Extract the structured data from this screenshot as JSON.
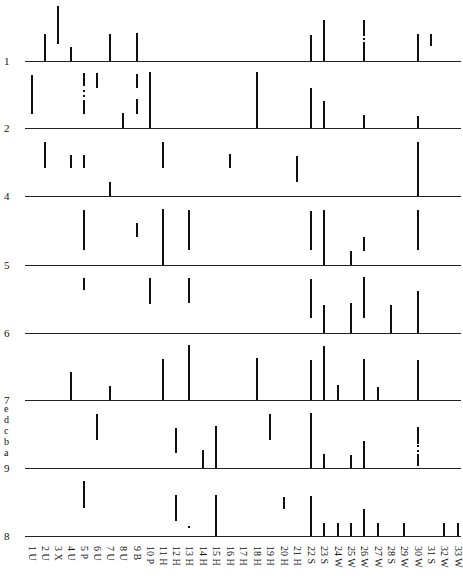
{
  "chart_data": {
    "type": "table",
    "rows": [
      {
        "label": "1",
        "baseline_y": 61
      },
      {
        "label": "2",
        "baseline_y": 128
      },
      {
        "label": "4",
        "baseline_y": 196
      },
      {
        "label": "5",
        "baseline_y": 265
      },
      {
        "label": "6",
        "baseline_y": 333
      },
      {
        "label": "7",
        "baseline_y": 400
      },
      {
        "label": "9",
        "baseline_y": 468,
        "sub_labels": [
          "e",
          "d",
          "c",
          "b",
          "a"
        ]
      },
      {
        "label": "8",
        "baseline_y": 536
      }
    ],
    "categories": [
      "1 U",
      "2 U",
      "3 X",
      "4 U",
      "5 P",
      "6 U",
      "7 U",
      "8 U",
      "9 B",
      "10 P",
      "11 H",
      "12 H",
      "13 H",
      "14 H",
      "15 H",
      "16 H",
      "17 H",
      "18 H",
      "19 H",
      "20 H",
      "21 H",
      "22 S",
      "23 S",
      "24 W",
      "25 W",
      "26 W",
      "27 W",
      "28 S",
      "29 W",
      "30 W",
      "31 S",
      "32 W",
      "33 W"
    ],
    "column_x": [
      32,
      45,
      58,
      71,
      84,
      97,
      110,
      123,
      137,
      150,
      163,
      176,
      189,
      203,
      216,
      230,
      243,
      257,
      270,
      284,
      297,
      311,
      324,
      338,
      351,
      364,
      378,
      391,
      404,
      418,
      431,
      444,
      458
    ],
    "segments": [
      {
        "row": 0,
        "col": 2,
        "y1": 34,
        "y2": 61
      },
      {
        "row": 0,
        "col": 3,
        "y1": 6,
        "y2": 44
      },
      {
        "row": 0,
        "col": 4,
        "y1": 47,
        "y2": 61
      },
      {
        "row": 0,
        "col": 7,
        "y1": 34,
        "y2": 61
      },
      {
        "row": 0,
        "col": 9,
        "y1": 33,
        "y2": 61
      },
      {
        "row": 0,
        "col": 22,
        "y1": 35,
        "y2": 61
      },
      {
        "row": 0,
        "col": 23,
        "y1": 20,
        "y2": 61
      },
      {
        "row": 0,
        "col": 26,
        "y1": 20,
        "y2": 36
      },
      {
        "row": 0,
        "col": 26,
        "y1": 38,
        "y2": 40
      },
      {
        "row": 0,
        "col": 26,
        "y1": 42,
        "y2": 61
      },
      {
        "row": 0,
        "col": 30,
        "y1": 34,
        "y2": 61
      },
      {
        "row": 0,
        "col": 31,
        "y1": 34,
        "y2": 46
      },
      {
        "row": 1,
        "col": 1,
        "y1": 75,
        "y2": 114
      },
      {
        "row": 1,
        "col": 5,
        "y1": 73,
        "y2": 86
      },
      {
        "row": 1,
        "col": 5,
        "y1": 90,
        "y2": 92
      },
      {
        "row": 1,
        "col": 5,
        "y1": 95,
        "y2": 97
      },
      {
        "row": 1,
        "col": 5,
        "y1": 100,
        "y2": 114
      },
      {
        "row": 1,
        "col": 6,
        "y1": 73,
        "y2": 88
      },
      {
        "row": 1,
        "col": 8,
        "y1": 113,
        "y2": 128
      },
      {
        "row": 1,
        "col": 9,
        "y1": 74,
        "y2": 88
      },
      {
        "row": 1,
        "col": 9,
        "y1": 99,
        "y2": 114
      },
      {
        "row": 1,
        "col": 10,
        "y1": 72,
        "y2": 128
      },
      {
        "row": 1,
        "col": 18,
        "y1": 72,
        "y2": 128
      },
      {
        "row": 1,
        "col": 22,
        "y1": 88,
        "y2": 128
      },
      {
        "row": 1,
        "col": 23,
        "y1": 101,
        "y2": 128
      },
      {
        "row": 1,
        "col": 26,
        "y1": 115,
        "y2": 128
      },
      {
        "row": 1,
        "col": 30,
        "y1": 116,
        "y2": 128
      },
      {
        "row": 2,
        "col": 2,
        "y1": 142,
        "y2": 168
      },
      {
        "row": 2,
        "col": 4,
        "y1": 155,
        "y2": 168
      },
      {
        "row": 2,
        "col": 5,
        "y1": 155,
        "y2": 168
      },
      {
        "row": 2,
        "col": 7,
        "y1": 182,
        "y2": 196
      },
      {
        "row": 2,
        "col": 11,
        "y1": 142,
        "y2": 168
      },
      {
        "row": 2,
        "col": 16,
        "y1": 154,
        "y2": 168
      },
      {
        "row": 2,
        "col": 21,
        "y1": 156,
        "y2": 182
      },
      {
        "row": 2,
        "col": 30,
        "y1": 142,
        "y2": 196
      },
      {
        "row": 3,
        "col": 5,
        "y1": 210,
        "y2": 250
      },
      {
        "row": 3,
        "col": 9,
        "y1": 223,
        "y2": 237
      },
      {
        "row": 3,
        "col": 11,
        "y1": 209,
        "y2": 265
      },
      {
        "row": 3,
        "col": 13,
        "y1": 210,
        "y2": 250
      },
      {
        "row": 3,
        "col": 22,
        "y1": 211,
        "y2": 250
      },
      {
        "row": 3,
        "col": 23,
        "y1": 210,
        "y2": 265
      },
      {
        "row": 3,
        "col": 25,
        "y1": 251,
        "y2": 265
      },
      {
        "row": 3,
        "col": 26,
        "y1": 237,
        "y2": 251
      },
      {
        "row": 3,
        "col": 30,
        "y1": 210,
        "y2": 250
      },
      {
        "row": 4,
        "col": 5,
        "y1": 278,
        "y2": 290
      },
      {
        "row": 4,
        "col": 10,
        "y1": 278,
        "y2": 304
      },
      {
        "row": 4,
        "col": 13,
        "y1": 278,
        "y2": 303
      },
      {
        "row": 4,
        "col": 22,
        "y1": 279,
        "y2": 318
      },
      {
        "row": 4,
        "col": 23,
        "y1": 305,
        "y2": 333
      },
      {
        "row": 4,
        "col": 25,
        "y1": 303,
        "y2": 333
      },
      {
        "row": 4,
        "col": 26,
        "y1": 277,
        "y2": 318
      },
      {
        "row": 4,
        "col": 28,
        "y1": 305,
        "y2": 333
      },
      {
        "row": 4,
        "col": 30,
        "y1": 291,
        "y2": 333
      },
      {
        "row": 5,
        "col": 4,
        "y1": 372,
        "y2": 400
      },
      {
        "row": 5,
        "col": 7,
        "y1": 386,
        "y2": 400
      },
      {
        "row": 5,
        "col": 11,
        "y1": 359,
        "y2": 400
      },
      {
        "row": 5,
        "col": 13,
        "y1": 345,
        "y2": 400
      },
      {
        "row": 5,
        "col": 18,
        "y1": 358,
        "y2": 400
      },
      {
        "row": 5,
        "col": 22,
        "y1": 360,
        "y2": 400
      },
      {
        "row": 5,
        "col": 23,
        "y1": 346,
        "y2": 400
      },
      {
        "row": 5,
        "col": 24,
        "y1": 385,
        "y2": 400
      },
      {
        "row": 5,
        "col": 26,
        "y1": 359,
        "y2": 400
      },
      {
        "row": 5,
        "col": 27,
        "y1": 387,
        "y2": 400
      },
      {
        "row": 5,
        "col": 30,
        "y1": 360,
        "y2": 400
      },
      {
        "row": 6,
        "col": 6,
        "y1": 414,
        "y2": 440
      },
      {
        "row": 6,
        "col": 12,
        "y1": 428,
        "y2": 453
      },
      {
        "row": 6,
        "col": 14,
        "y1": 450,
        "y2": 468
      },
      {
        "row": 6,
        "col": 15,
        "y1": 426,
        "y2": 468
      },
      {
        "row": 6,
        "col": 19,
        "y1": 414,
        "y2": 440
      },
      {
        "row": 6,
        "col": 22,
        "y1": 413,
        "y2": 468
      },
      {
        "row": 6,
        "col": 23,
        "y1": 454,
        "y2": 468
      },
      {
        "row": 6,
        "col": 25,
        "y1": 455,
        "y2": 468
      },
      {
        "row": 6,
        "col": 26,
        "y1": 441,
        "y2": 468
      },
      {
        "row": 6,
        "col": 30,
        "y1": 427,
        "y2": 444
      },
      {
        "row": 6,
        "col": 30,
        "y1": 445,
        "y2": 447
      },
      {
        "row": 6,
        "col": 30,
        "y1": 450,
        "y2": 452
      },
      {
        "row": 6,
        "col": 30,
        "y1": 454,
        "y2": 466
      },
      {
        "row": 7,
        "col": 5,
        "y1": 481,
        "y2": 508
      },
      {
        "row": 7,
        "col": 12,
        "y1": 495,
        "y2": 521
      },
      {
        "row": 7,
        "col": 13,
        "y1": 526,
        "y2": 528
      },
      {
        "row": 7,
        "col": 15,
        "y1": 495,
        "y2": 536
      },
      {
        "row": 7,
        "col": 20,
        "y1": 497,
        "y2": 509
      },
      {
        "row": 7,
        "col": 22,
        "y1": 496,
        "y2": 536
      },
      {
        "row": 7,
        "col": 23,
        "y1": 523,
        "y2": 536
      },
      {
        "row": 7,
        "col": 24,
        "y1": 523,
        "y2": 536
      },
      {
        "row": 7,
        "col": 25,
        "y1": 523,
        "y2": 536
      },
      {
        "row": 7,
        "col": 26,
        "y1": 509,
        "y2": 536
      },
      {
        "row": 7,
        "col": 27,
        "y1": 523,
        "y2": 536
      },
      {
        "row": 7,
        "col": 29,
        "y1": 523,
        "y2": 536
      },
      {
        "row": 7,
        "col": 32,
        "y1": 523,
        "y2": 536
      },
      {
        "row": 7,
        "col": 33,
        "y1": 523,
        "y2": 536
      }
    ],
    "title": "",
    "xlabel": "",
    "ylabel": "",
    "grid": false,
    "legend": null
  }
}
